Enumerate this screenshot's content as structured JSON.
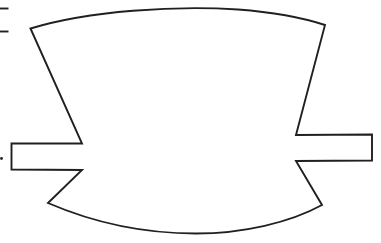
{
  "document": {
    "title": "Line drawing",
    "background_color": "#ffffff",
    "width": 381,
    "height": 243
  },
  "figure": {
    "name": "banner-outline-shape",
    "stroke_color": "#231f20",
    "fill_color": "#ffffff",
    "stroke_width": 1.9,
    "outline_path": "M 30.5 28.5 C 90 10.5 175 5.5 238 9.5 C 278 12.5 305 18.5 325.0 25.0 L 296.0 135.0 L 372.0 134.5 L 372.0 160.5 L 296.0 161.0 L 322.0 205.0 C 290 222.5 243 233.5 196 233.5 C 142 233.5 92 222.0 48.0 203.0 L 82.0 170.0 L 11.5 169.5 L 11.5 143.5 L 82.0 143.5 Z",
    "vertices": [
      {
        "name": "top-left-corner",
        "x": 30.5,
        "y": 28.5
      },
      {
        "name": "top-right-corner",
        "x": 325.0,
        "y": 25.0
      },
      {
        "name": "right-notch-top",
        "x": 296.0,
        "y": 135.0
      },
      {
        "name": "right-tab-top-right",
        "x": 372.0,
        "y": 134.5
      },
      {
        "name": "right-tab-bottom-right",
        "x": 372.0,
        "y": 160.5
      },
      {
        "name": "right-notch-bottom",
        "x": 296.0,
        "y": 161.0
      },
      {
        "name": "bottom-right-corner",
        "x": 322.0,
        "y": 205.0
      },
      {
        "name": "bottom-left-corner",
        "x": 48.0,
        "y": 203.0
      },
      {
        "name": "left-notch-bottom",
        "x": 82.0,
        "y": 170.0
      },
      {
        "name": "left-tab-bottom-left",
        "x": 11.5,
        "y": 169.5
      },
      {
        "name": "left-tab-top-left",
        "x": 11.5,
        "y": 143.5
      },
      {
        "name": "left-notch-top",
        "x": 82.0,
        "y": 143.5
      }
    ]
  },
  "annotations": {
    "tick_marks": [
      {
        "name": "tick-upper",
        "x1": 0,
        "y1": 8.5,
        "x2": 8.5,
        "y2": 8.5
      },
      {
        "name": "tick-lower",
        "x1": 0,
        "y1": 31.5,
        "x2": 8.5,
        "y2": 31.5
      }
    ],
    "edge_dot": {
      "name": "left-edge-dot",
      "cx": 1.5,
      "cy": 158.5,
      "r": 1.4
    }
  }
}
